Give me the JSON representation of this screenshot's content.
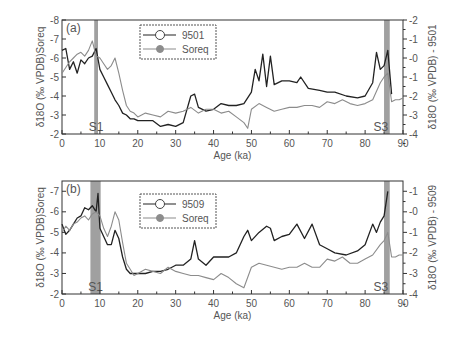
{
  "chart_data": [
    {
      "type": "line",
      "panel_label": "(a)",
      "xlabel": "Age (ka)",
      "ylabel_left": "δ18O (‰ VPDB)Soreq",
      "ylabel_right": "δ18O (‰ VPDB) - 9501",
      "xlim": [
        0,
        90
      ],
      "ylim_left": [
        -2,
        -8
      ],
      "ylim_right": [
        4,
        -2
      ],
      "x_ticks": [
        0,
        10,
        20,
        30,
        40,
        50,
        60,
        70,
        80,
        90
      ],
      "y_ticks_left": [
        -8,
        -7,
        -6,
        -5,
        -4,
        -3,
        -2
      ],
      "y_ticks_right": [
        -2,
        -1,
        0,
        1,
        2,
        3,
        4
      ],
      "legend": [
        "9501",
        "Soreq"
      ],
      "shaded_bands": [
        {
          "label": "S1",
          "x": [
            8.5,
            9.5
          ]
        },
        {
          "label": "S3",
          "x": [
            85,
            86.5
          ]
        }
      ],
      "series": [
        {
          "name": "9501",
          "axis": "right",
          "color": "#222222",
          "x": [
            0,
            1,
            2,
            3,
            4,
            5,
            6,
            7,
            8,
            9,
            10,
            11,
            12,
            13,
            14,
            15,
            16,
            17,
            18,
            19,
            20,
            22,
            24,
            26,
            28,
            30,
            32,
            34,
            35,
            36,
            38,
            40,
            42,
            44,
            46,
            48,
            50,
            51,
            52,
            53,
            54,
            55,
            56,
            58,
            60,
            62,
            63,
            65,
            68,
            70,
            72,
            75,
            78,
            80,
            82,
            83,
            84,
            85,
            86,
            87
          ],
          "y": [
            -0.4,
            -0.5,
            0.6,
            0.2,
            0.8,
            0.1,
            0.3,
            0.0,
            -0.1,
            -0.5,
            0.6,
            1.0,
            1.4,
            1.8,
            2.2,
            2.5,
            2.9,
            3.0,
            3.2,
            3.2,
            3.3,
            3.3,
            3.3,
            3.6,
            3.5,
            3.6,
            3.4,
            2.0,
            1.9,
            2.6,
            2.8,
            2.7,
            2.4,
            2.5,
            2.5,
            2.4,
            1.8,
            0.6,
            1.2,
            -0.2,
            1.5,
            -0.1,
            1.4,
            1.2,
            1.2,
            1.3,
            1.0,
            1.6,
            1.7,
            1.8,
            1.8,
            2.0,
            2.1,
            2.0,
            1.3,
            -0.3,
            0.6,
            0.4,
            -0.4,
            1.9
          ]
        },
        {
          "name": "Soreq",
          "axis": "left",
          "color": "#8c8c8c",
          "x": [
            0,
            1,
            2,
            3,
            4,
            5,
            6,
            7,
            8,
            9,
            10,
            11,
            12,
            13,
            14,
            15,
            16,
            17,
            18,
            19,
            20,
            22,
            24,
            26,
            28,
            30,
            32,
            34,
            36,
            38,
            40,
            42,
            44,
            46,
            48,
            49,
            50,
            52,
            54,
            56,
            58,
            60,
            62,
            64,
            66,
            68,
            70,
            72,
            74,
            76,
            78,
            80,
            82,
            84,
            85,
            86,
            87,
            88,
            89,
            90
          ],
          "y": [
            -5.2,
            -5.5,
            -5.8,
            -6.0,
            -6.2,
            -6.3,
            -6.1,
            -6.4,
            -6.9,
            -6.1,
            -6.0,
            -5.7,
            -5.4,
            -5.6,
            -6.0,
            -5.2,
            -4.3,
            -3.5,
            -3.2,
            -3.1,
            -2.9,
            -3.1,
            -3.0,
            -2.9,
            -3.2,
            -3.1,
            -3.2,
            -3.4,
            -3.1,
            -3.3,
            -3.3,
            -3.1,
            -3.2,
            -2.9,
            -2.6,
            -2.3,
            -3.3,
            -3.6,
            -3.4,
            -3.2,
            -3.3,
            -3.4,
            -3.4,
            -3.5,
            -3.5,
            -3.4,
            -3.7,
            -3.6,
            -3.8,
            -3.6,
            -3.5,
            -3.6,
            -3.8,
            -4.7,
            -5.0,
            -5.2,
            -3.7,
            -3.8,
            -3.8,
            -3.9
          ]
        }
      ]
    },
    {
      "type": "line",
      "panel_label": "(b)",
      "xlabel": "Age (ka)",
      "ylabel_left": "δ18O (‰ VPDB)Soreq",
      "ylabel_right": "δ18O (‰ VPDB) - 9509",
      "xlim": [
        0,
        90
      ],
      "ylim_left": [
        -2,
        -7.5
      ],
      "ylim_right": [
        4,
        -1.5
      ],
      "x_ticks": [
        0,
        10,
        20,
        30,
        40,
        50,
        60,
        70,
        80,
        90
      ],
      "y_ticks_left": [
        -7,
        -6,
        -5,
        -4,
        -3,
        -2
      ],
      "y_ticks_right": [
        -1,
        0,
        1,
        2,
        3,
        4
      ],
      "legend": [
        "9509",
        "Soreq"
      ],
      "shaded_bands": [
        {
          "label": "S1",
          "x": [
            7.5,
            10.2
          ]
        },
        {
          "label": "S3",
          "x": [
            85,
            86.5
          ]
        }
      ],
      "series": [
        {
          "name": "9509",
          "axis": "right",
          "color": "#222222",
          "x": [
            0,
            1,
            2,
            3,
            4,
            5,
            6,
            7,
            8,
            9,
            9.5,
            10,
            11,
            12,
            13,
            14,
            15,
            16,
            17,
            18,
            19,
            20,
            22,
            24,
            26,
            28,
            30,
            32,
            34,
            35,
            36,
            38,
            40,
            42,
            44,
            46,
            48,
            49,
            50,
            52,
            54,
            55,
            56,
            58,
            60,
            62,
            64,
            66,
            68,
            70,
            72,
            75,
            78,
            80,
            82,
            83,
            84,
            85,
            86
          ],
          "y": [
            0.6,
            1.1,
            0.9,
            0.6,
            0.3,
            0.2,
            -0.2,
            -0.1,
            -0.3,
            0.0,
            -0.9,
            0.8,
            1.2,
            1.6,
            1.6,
            0.9,
            1.3,
            2.2,
            2.8,
            3.0,
            3.0,
            3.0,
            3.0,
            2.9,
            2.9,
            2.8,
            2.6,
            2.6,
            2.3,
            1.4,
            2.3,
            2.6,
            2.2,
            2.2,
            2.2,
            2.0,
            1.2,
            0.9,
            1.4,
            1.0,
            0.7,
            0.8,
            1.4,
            1.2,
            1.1,
            0.6,
            1.3,
            0.6,
            1.6,
            1.8,
            2.0,
            2.1,
            1.9,
            1.6,
            0.6,
            1.0,
            0.5,
            0.2,
            -1.0
          ]
        },
        {
          "name": "Soreq",
          "axis": "left",
          "color": "#8c8c8c",
          "x": [
            0,
            1,
            2,
            3,
            4,
            5,
            6,
            7,
            8,
            9,
            10,
            11,
            12,
            13,
            14,
            15,
            16,
            17,
            18,
            19,
            20,
            22,
            24,
            26,
            28,
            30,
            32,
            34,
            36,
            38,
            40,
            42,
            44,
            46,
            48,
            50,
            52,
            54,
            56,
            58,
            60,
            62,
            64,
            66,
            68,
            70,
            72,
            74,
            76,
            78,
            80,
            82,
            84,
            85,
            86,
            87,
            88,
            89,
            90
          ],
          "y": [
            -5.0,
            -5.3,
            -5.1,
            -5.4,
            -5.5,
            -5.7,
            -5.8,
            -5.6,
            -5.9,
            -6.0,
            -5.8,
            -5.2,
            -4.8,
            -5.3,
            -6.0,
            -5.6,
            -4.5,
            -3.5,
            -3.2,
            -2.9,
            -3.0,
            -3.2,
            -3.1,
            -3.0,
            -3.3,
            -3.1,
            -3.0,
            -2.9,
            -2.9,
            -2.8,
            -2.7,
            -3.0,
            -2.8,
            -2.5,
            -2.3,
            -3.3,
            -3.5,
            -3.4,
            -3.3,
            -3.2,
            -3.3,
            -3.3,
            -3.5,
            -3.3,
            -3.3,
            -3.7,
            -3.6,
            -3.8,
            -3.5,
            -3.5,
            -3.7,
            -3.9,
            -4.4,
            -4.6,
            -5.0,
            -3.8,
            -3.8,
            -3.9,
            -3.9
          ]
        }
      ]
    }
  ]
}
